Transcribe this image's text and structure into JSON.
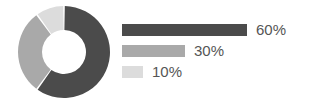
{
  "chart_data": {
    "type": "pie",
    "variant": "donut",
    "title": "",
    "subtitle": "",
    "xlabel": "",
    "ylabel": "",
    "grid": false,
    "legend_position": "right",
    "legend_style": "horizontal-bars-proportional",
    "start_angle_deg": 0,
    "direction": "clockwise",
    "inner_radius_ratio": 0.46,
    "categories": [
      "60%",
      "30%",
      "10%"
    ],
    "values": [
      60,
      30,
      10
    ],
    "labels": [
      "60%",
      "30%",
      "10%"
    ],
    "colors": [
      "#4b4b4b",
      "#a9a9a9",
      "#dcdcdc"
    ],
    "segments": [
      {
        "label": "60%",
        "value": 60,
        "color": "#4b4b4b",
        "bar_width_px": 125
      },
      {
        "label": "30%",
        "value": 30,
        "color": "#a9a9a9",
        "bar_width_px": 63
      },
      {
        "label": "10%",
        "value": 10,
        "color": "#dcdcdc",
        "bar_width_px": 21
      }
    ]
  },
  "donut": {
    "name": "donut-chart",
    "center_x": 48,
    "center_y": 48,
    "outer_radius": 46,
    "inner_radius": 22,
    "gap_deg": 2,
    "background": "#ffffff"
  },
  "legend": {
    "rows": [
      {
        "label": "60%",
        "color": "#4b4b4b",
        "bar_width_px": 125
      },
      {
        "label": "30%",
        "color": "#a9a9a9",
        "bar_width_px": 63
      },
      {
        "label": "10%",
        "color": "#dcdcdc",
        "bar_width_px": 21
      }
    ]
  },
  "canvas": {
    "width": 309,
    "height": 106,
    "background": "#ffffff",
    "text_color": "#555555"
  }
}
